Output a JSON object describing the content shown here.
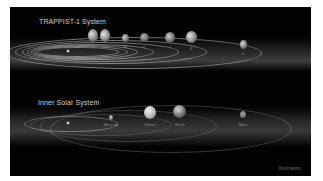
{
  "trappist": {
    "title": "TRAPPIST-1 System",
    "planets": [
      {
        "label": "b"
      },
      {
        "label": "c"
      },
      {
        "label": "d"
      },
      {
        "label": "e"
      },
      {
        "label": "f"
      },
      {
        "label": "g"
      },
      {
        "label": "h"
      }
    ]
  },
  "solar": {
    "title": "Inner Solar System",
    "planets": [
      {
        "label": "Mercury"
      },
      {
        "label": "Venus"
      },
      {
        "label": "Earth"
      },
      {
        "label": "Mars"
      }
    ]
  },
  "credit": "Illustration",
  "colors": {
    "background": "#020202",
    "text": "#cfcfcf",
    "orbit": "#c8c8c8"
  }
}
